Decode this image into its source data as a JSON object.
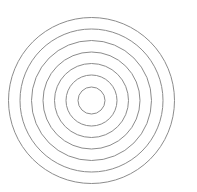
{
  "figure": {
    "type": "concentric-circles",
    "ring_count": 7,
    "center": {
      "x": 91.5,
      "y": 100.5
    },
    "radii": [
      13.5,
      25.5,
      37,
      48.5,
      60,
      71.5,
      83
    ],
    "stroke_color": "#8c8c8c",
    "stroke_width": 1,
    "fill": "none",
    "background": "#ffffff"
  }
}
